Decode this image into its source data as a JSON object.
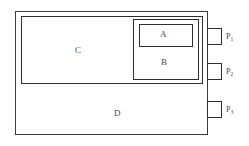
{
  "diagram": {
    "background_color": "#ffffff",
    "line_color": "#2e2e2e",
    "text_color": "#4a4a4a",
    "regions": [
      {
        "id": "A",
        "label": "A",
        "description": "innermost box nested inside region B"
      },
      {
        "id": "B",
        "label": "B",
        "description": "box inside region C containing region A"
      },
      {
        "id": "C",
        "label": "C",
        "description": "upper enclosing region containing box B"
      },
      {
        "id": "D",
        "label": "D",
        "description": "lower region of device chassis"
      }
    ],
    "ports": [
      {
        "id": "P1",
        "label": "P",
        "subscript": "1"
      },
      {
        "id": "P2",
        "label": "P",
        "subscript": "2"
      },
      {
        "id": "P3",
        "label": "P",
        "subscript": "3"
      }
    ]
  }
}
